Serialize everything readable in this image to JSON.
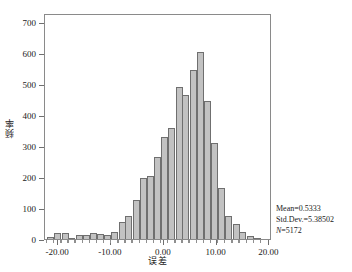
{
  "chart_data": {
    "type": "bar",
    "title": "",
    "subtitle": "",
    "xlabel": "误差",
    "ylabel": "频率",
    "xlim": [
      -22.5,
      20.5
    ],
    "ylim": [
      0,
      730
    ],
    "grid": false,
    "legend": null,
    "bin_width": 1.34,
    "x_ticks": [
      -20.0,
      -10.0,
      0.0,
      10.0,
      20.0
    ],
    "x_tick_labels": [
      "-20.00",
      "-10.00",
      "0.00",
      "10.00",
      "20.00"
    ],
    "y_ticks": [
      0,
      100,
      200,
      300,
      400,
      500,
      600,
      700
    ],
    "y_tick_labels": [
      "0",
      "100",
      "200",
      "300",
      "400",
      "500",
      "600",
      "700"
    ],
    "bin_centers": [
      -21.4,
      -20.1,
      -18.7,
      -17.4,
      -16.0,
      -14.7,
      -13.3,
      -12.0,
      -10.6,
      -9.3,
      -7.9,
      -6.6,
      -5.2,
      -3.9,
      -2.5,
      -1.2,
      0.2,
      1.5,
      2.9,
      4.2,
      5.6,
      6.9,
      8.3,
      9.6,
      11.0,
      12.3,
      13.7,
      15.0,
      16.4,
      17.7
    ],
    "values": [
      5,
      18,
      18,
      2,
      12,
      13,
      19,
      16,
      12,
      22,
      56,
      75,
      125,
      196,
      205,
      265,
      328,
      359,
      490,
      465,
      547,
      603,
      446,
      311,
      165,
      73,
      47,
      22,
      9,
      3
    ],
    "annotations": [
      "Mean=0.5333",
      "Std.Dev.=5.38502",
      "N=5172"
    ],
    "stats": {
      "mean_label": "Mean=",
      "mean_value": "0.5333",
      "std_label": "Std.Dev.=",
      "std_value": "5.38502",
      "n_label": "N",
      "n_value": "=5172"
    },
    "colors": {
      "bar_fill": "#c2c2c2",
      "bar_edge": "#6f6f6f",
      "frame": "#8a8a8a",
      "text": "#1a1a1a",
      "background": "#ffffff"
    }
  }
}
